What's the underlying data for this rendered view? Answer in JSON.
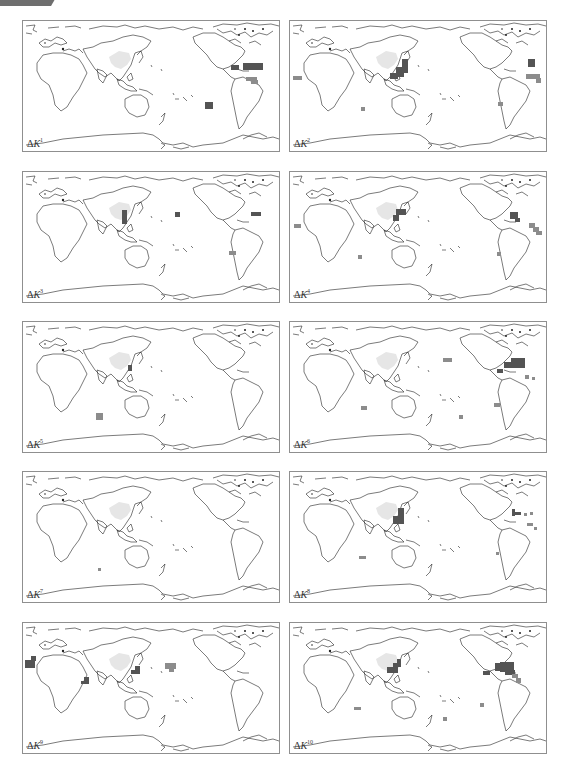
{
  "figure": {
    "colors": {
      "dark_cell": "#545454",
      "medium_cell": "#8c8c8c",
      "land_highlight": "#e6e6e6",
      "coastline": "#222222",
      "border": "#8f8f8f"
    },
    "panels": [
      {
        "symbol": "ΔK",
        "index": "1",
        "cells": [
          {
            "x": 220,
            "y": 42,
            "w": 20,
            "h": 7,
            "shade": "dark"
          },
          {
            "x": 208,
            "y": 44,
            "w": 8,
            "h": 5,
            "shade": "dark"
          },
          {
            "x": 223,
            "y": 56,
            "w": 11,
            "h": 4,
            "shade": "medium"
          },
          {
            "x": 228,
            "y": 59,
            "w": 7,
            "h": 4,
            "shade": "medium"
          },
          {
            "x": 182,
            "y": 81,
            "w": 8,
            "h": 7,
            "shade": "dark"
          }
        ]
      },
      {
        "symbol": "ΔK",
        "index": "2",
        "cells": [
          {
            "x": 3,
            "y": 55,
            "w": 9,
            "h": 4,
            "shade": "medium"
          },
          {
            "x": 112,
            "y": 38,
            "w": 6,
            "h": 14,
            "shade": "dark"
          },
          {
            "x": 106,
            "y": 46,
            "w": 8,
            "h": 10,
            "shade": "dark"
          },
          {
            "x": 100,
            "y": 52,
            "w": 8,
            "h": 6,
            "shade": "dark"
          },
          {
            "x": 238,
            "y": 38,
            "w": 7,
            "h": 8,
            "shade": "dark"
          },
          {
            "x": 236,
            "y": 53,
            "w": 14,
            "h": 5,
            "shade": "medium"
          },
          {
            "x": 246,
            "y": 57,
            "w": 5,
            "h": 5,
            "shade": "medium"
          },
          {
            "x": 71,
            "y": 86,
            "w": 4,
            "h": 4,
            "shade": "medium"
          },
          {
            "x": 208,
            "y": 81,
            "w": 5,
            "h": 4,
            "shade": "medium"
          }
        ]
      },
      {
        "symbol": "ΔK",
        "index": "3",
        "cells": [
          {
            "x": 99,
            "y": 38,
            "w": 5,
            "h": 14,
            "shade": "dark"
          },
          {
            "x": 152,
            "y": 40,
            "w": 5,
            "h": 5,
            "shade": "dark"
          },
          {
            "x": 228,
            "y": 40,
            "w": 10,
            "h": 4,
            "shade": "dark"
          },
          {
            "x": 206,
            "y": 79,
            "w": 7,
            "h": 4,
            "shade": "medium"
          }
        ]
      },
      {
        "symbol": "ΔK",
        "index": "4",
        "cells": [
          {
            "x": 4,
            "y": 52,
            "w": 7,
            "h": 4,
            "shade": "medium"
          },
          {
            "x": 106,
            "y": 37,
            "w": 10,
            "h": 6,
            "shade": "dark"
          },
          {
            "x": 103,
            "y": 43,
            "w": 6,
            "h": 6,
            "shade": "dark"
          },
          {
            "x": 220,
            "y": 40,
            "w": 8,
            "h": 7,
            "shade": "dark"
          },
          {
            "x": 225,
            "y": 46,
            "w": 5,
            "h": 4,
            "shade": "dark"
          },
          {
            "x": 239,
            "y": 51,
            "w": 6,
            "h": 5,
            "shade": "medium"
          },
          {
            "x": 243,
            "y": 55,
            "w": 6,
            "h": 5,
            "shade": "medium"
          },
          {
            "x": 246,
            "y": 59,
            "w": 6,
            "h": 4,
            "shade": "medium"
          },
          {
            "x": 68,
            "y": 83,
            "w": 4,
            "h": 4,
            "shade": "medium"
          },
          {
            "x": 207,
            "y": 80,
            "w": 4,
            "h": 4,
            "shade": "medium"
          }
        ]
      },
      {
        "symbol": "ΔK",
        "index": "5",
        "cells": [
          {
            "x": 105,
            "y": 43,
            "w": 4,
            "h": 6,
            "shade": "dark"
          },
          {
            "x": 73,
            "y": 91,
            "w": 7,
            "h": 7,
            "shade": "medium"
          }
        ]
      },
      {
        "symbol": "ΔK",
        "index": "6",
        "cells": [
          {
            "x": 153,
            "y": 36,
            "w": 9,
            "h": 4,
            "shade": "medium"
          },
          {
            "x": 221,
            "y": 36,
            "w": 14,
            "h": 10,
            "shade": "dark"
          },
          {
            "x": 214,
            "y": 40,
            "w": 8,
            "h": 6,
            "shade": "dark"
          },
          {
            "x": 207,
            "y": 47,
            "w": 6,
            "h": 4,
            "shade": "dark"
          },
          {
            "x": 235,
            "y": 53,
            "w": 4,
            "h": 4,
            "shade": "medium"
          },
          {
            "x": 242,
            "y": 55,
            "w": 3,
            "h": 3,
            "shade": "medium"
          },
          {
            "x": 71,
            "y": 84,
            "w": 6,
            "h": 4,
            "shade": "medium"
          },
          {
            "x": 204,
            "y": 81,
            "w": 6,
            "h": 4,
            "shade": "medium"
          },
          {
            "x": 169,
            "y": 93,
            "w": 4,
            "h": 4,
            "shade": "medium"
          }
        ]
      },
      {
        "symbol": "ΔK",
        "index": "7",
        "cells": [
          {
            "x": 75,
            "y": 96,
            "w": 3,
            "h": 3,
            "shade": "medium"
          }
        ]
      },
      {
        "symbol": "ΔK",
        "index": "8",
        "cells": [
          {
            "x": 108,
            "y": 36,
            "w": 6,
            "h": 16,
            "shade": "dark"
          },
          {
            "x": 103,
            "y": 44,
            "w": 6,
            "h": 8,
            "shade": "dark"
          },
          {
            "x": 222,
            "y": 37,
            "w": 3,
            "h": 7,
            "shade": "dark"
          },
          {
            "x": 222,
            "y": 40,
            "w": 9,
            "h": 3,
            "shade": "dark"
          },
          {
            "x": 234,
            "y": 41,
            "w": 3,
            "h": 3,
            "shade": "medium"
          },
          {
            "x": 240,
            "y": 40,
            "w": 3,
            "h": 3,
            "shade": "medium"
          },
          {
            "x": 237,
            "y": 51,
            "w": 6,
            "h": 3,
            "shade": "medium"
          },
          {
            "x": 244,
            "y": 55,
            "w": 3,
            "h": 3,
            "shade": "medium"
          },
          {
            "x": 69,
            "y": 84,
            "w": 7,
            "h": 3,
            "shade": "medium"
          },
          {
            "x": 206,
            "y": 80,
            "w": 3,
            "h": 3,
            "shade": "medium"
          }
        ]
      },
      {
        "symbol": "ΔK",
        "index": "9",
        "cells": [
          {
            "x": 2,
            "y": 37,
            "w": 10,
            "h": 8,
            "shade": "dark"
          },
          {
            "x": 8,
            "y": 33,
            "w": 5,
            "h": 5,
            "shade": "dark"
          },
          {
            "x": 112,
            "y": 43,
            "w": 5,
            "h": 8,
            "shade": "dark"
          },
          {
            "x": 108,
            "y": 47,
            "w": 5,
            "h": 4,
            "shade": "dark"
          },
          {
            "x": 61,
            "y": 54,
            "w": 5,
            "h": 7,
            "shade": "dark"
          },
          {
            "x": 58,
            "y": 58,
            "w": 5,
            "h": 3,
            "shade": "dark"
          },
          {
            "x": 142,
            "y": 40,
            "w": 11,
            "h": 6,
            "shade": "medium"
          },
          {
            "x": 146,
            "y": 45,
            "w": 5,
            "h": 4,
            "shade": "medium"
          }
        ]
      },
      {
        "symbol": "ΔK",
        "index": "10",
        "cells": [
          {
            "x": 97,
            "y": 44,
            "w": 6,
            "h": 6,
            "shade": "dark"
          },
          {
            "x": 103,
            "y": 40,
            "w": 5,
            "h": 10,
            "shade": "dark"
          },
          {
            "x": 107,
            "y": 36,
            "w": 4,
            "h": 8,
            "shade": "dark"
          },
          {
            "x": 205,
            "y": 40,
            "w": 8,
            "h": 8,
            "shade": "dark"
          },
          {
            "x": 210,
            "y": 39,
            "w": 14,
            "h": 10,
            "shade": "dark"
          },
          {
            "x": 215,
            "y": 47,
            "w": 10,
            "h": 5,
            "shade": "dark"
          },
          {
            "x": 193,
            "y": 48,
            "w": 7,
            "h": 4,
            "shade": "dark"
          },
          {
            "x": 222,
            "y": 51,
            "w": 6,
            "h": 4,
            "shade": "medium"
          },
          {
            "x": 226,
            "y": 55,
            "w": 5,
            "h": 5,
            "shade": "medium"
          },
          {
            "x": 64,
            "y": 84,
            "w": 7,
            "h": 3,
            "shade": "medium"
          },
          {
            "x": 190,
            "y": 80,
            "w": 4,
            "h": 4,
            "shade": "medium"
          },
          {
            "x": 153,
            "y": 94,
            "w": 4,
            "h": 4,
            "shade": "medium"
          }
        ]
      }
    ]
  }
}
